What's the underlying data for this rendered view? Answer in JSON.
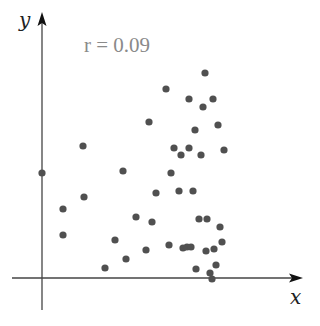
{
  "chart_data": {
    "type": "scatter",
    "title": "",
    "xlabel": "x",
    "ylabel": "y",
    "annotation": "r = 0.09",
    "grid": false,
    "legend": null,
    "axes": {
      "origin_px": [
        42,
        278
      ],
      "x_end_px": 303,
      "y_end_px": 12,
      "x_start_px": 12,
      "y_start_px": 310,
      "ticks": "none"
    },
    "marker": {
      "color": "#505050",
      "radius": 3.6
    },
    "points_px": [
      [
        205,
        73
      ],
      [
        166,
        89
      ],
      [
        189,
        99
      ],
      [
        213,
        99
      ],
      [
        203,
        107
      ],
      [
        149,
        122
      ],
      [
        218,
        125
      ],
      [
        195,
        130
      ],
      [
        174,
        148
      ],
      [
        189,
        148
      ],
      [
        181,
        155
      ],
      [
        201,
        155
      ],
      [
        224,
        150
      ],
      [
        83,
        146
      ],
      [
        42,
        173
      ],
      [
        123,
        171
      ],
      [
        171,
        173
      ],
      [
        156,
        193
      ],
      [
        179,
        191
      ],
      [
        193,
        191
      ],
      [
        84,
        197
      ],
      [
        63,
        209
      ],
      [
        136,
        217
      ],
      [
        152,
        222
      ],
      [
        199,
        219
      ],
      [
        207,
        219
      ],
      [
        220,
        227
      ],
      [
        63,
        235
      ],
      [
        115,
        240
      ],
      [
        146,
        250
      ],
      [
        169,
        245
      ],
      [
        183,
        248
      ],
      [
        187,
        247
      ],
      [
        191,
        247
      ],
      [
        206,
        251
      ],
      [
        214,
        249
      ],
      [
        222,
        242
      ],
      [
        126,
        259
      ],
      [
        105,
        268
      ],
      [
        216,
        265
      ],
      [
        196,
        269
      ],
      [
        210,
        273
      ],
      [
        212,
        279
      ]
    ],
    "points": [
      {
        "x": 163,
        "y": 205
      },
      {
        "x": 124,
        "y": 189
      },
      {
        "x": 147,
        "y": 179
      },
      {
        "x": 171,
        "y": 179
      },
      {
        "x": 161,
        "y": 171
      },
      {
        "x": 107,
        "y": 156
      },
      {
        "x": 176,
        "y": 153
      },
      {
        "x": 153,
        "y": 148
      },
      {
        "x": 132,
        "y": 130
      },
      {
        "x": 147,
        "y": 130
      },
      {
        "x": 139,
        "y": 123
      },
      {
        "x": 159,
        "y": 123
      },
      {
        "x": 182,
        "y": 128
      },
      {
        "x": 41,
        "y": 132
      },
      {
        "x": 0,
        "y": 105
      },
      {
        "x": 81,
        "y": 107
      },
      {
        "x": 129,
        "y": 105
      },
      {
        "x": 114,
        "y": 85
      },
      {
        "x": 137,
        "y": 87
      },
      {
        "x": 151,
        "y": 87
      },
      {
        "x": 42,
        "y": 81
      },
      {
        "x": 21,
        "y": 69
      },
      {
        "x": 94,
        "y": 61
      },
      {
        "x": 110,
        "y": 56
      },
      {
        "x": 157,
        "y": 59
      },
      {
        "x": 165,
        "y": 59
      },
      {
        "x": 178,
        "y": 51
      },
      {
        "x": 21,
        "y": 43
      },
      {
        "x": 73,
        "y": 38
      },
      {
        "x": 104,
        "y": 28
      },
      {
        "x": 127,
        "y": 33
      },
      {
        "x": 141,
        "y": 30
      },
      {
        "x": 145,
        "y": 31
      },
      {
        "x": 149,
        "y": 31
      },
      {
        "x": 164,
        "y": 27
      },
      {
        "x": 172,
        "y": 29
      },
      {
        "x": 180,
        "y": 36
      },
      {
        "x": 84,
        "y": 19
      },
      {
        "x": 63,
        "y": 10
      },
      {
        "x": 174,
        "y": 13
      },
      {
        "x": 154,
        "y": 9
      },
      {
        "x": 168,
        "y": 5
      },
      {
        "x": 170,
        "y": -1
      }
    ],
    "units_note": "point x/y are pixel offsets from the axes origin (no numeric tick scale shown)"
  }
}
